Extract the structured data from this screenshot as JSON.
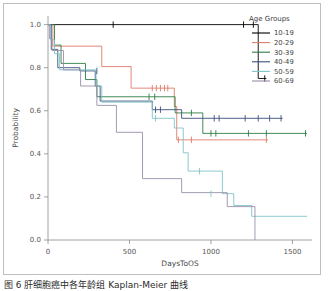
{
  "figure": {
    "caption": "图 6   肝细胞癌中各年龄组 Kaplan-Meier 曲线",
    "background_color": "#ffffff",
    "frame_color": "#bfbfbf"
  },
  "legend": {
    "title": "Age Groups",
    "position": "top-right",
    "entries": [
      {
        "label": "10-19",
        "color": "#000000"
      },
      {
        "label": "20-29",
        "color": "#e07b6a"
      },
      {
        "label": "30-39",
        "color": "#2f7d46"
      },
      {
        "label": "40-49",
        "color": "#3b4f7d"
      },
      {
        "label": "50-59",
        "color": "#7fc4c9"
      },
      {
        "label": "60-69",
        "color": "#9a8fa8"
      }
    ]
  },
  "chart_data": {
    "type": "line",
    "title": "",
    "subtitle": "",
    "xlabel": "DaysToOS",
    "ylabel": "Probability",
    "xlim": [
      0,
      1620
    ],
    "ylim": [
      0.0,
      1.04
    ],
    "xticks": [
      0,
      500,
      1000,
      1500
    ],
    "xtick_labels": [
      "0",
      "500",
      "1000",
      "1500"
    ],
    "yticks": [
      0.0,
      0.2,
      0.4,
      0.6,
      0.8,
      1.0
    ],
    "ytick_labels": [
      "0.0",
      "0.2",
      "0.4",
      "0.6",
      "0.8",
      "1.0"
    ],
    "grid": false,
    "legend_position": "upper right",
    "series": [
      {
        "name": "10-19",
        "color": "#000000",
        "points": [
          [
            0,
            1.0
          ],
          [
            1290,
            1.0
          ],
          [
            1290,
            0.75
          ],
          [
            1340,
            0.75
          ]
        ],
        "censored": [
          [
            400,
            1.0
          ],
          [
            1200,
            1.0
          ],
          [
            1260,
            1.0
          ],
          [
            1330,
            0.75
          ]
        ]
      },
      {
        "name": "20-29",
        "color": "#e07b6a",
        "points": [
          [
            0,
            1.0
          ],
          [
            30,
            1.0
          ],
          [
            30,
            0.9
          ],
          [
            330,
            0.9
          ],
          [
            330,
            0.805
          ],
          [
            510,
            0.805
          ],
          [
            510,
            0.705
          ],
          [
            775,
            0.705
          ],
          [
            775,
            0.62
          ],
          [
            790,
            0.62
          ],
          [
            790,
            0.465
          ],
          [
            1350,
            0.465
          ]
        ],
        "censored": [
          [
            640,
            0.705
          ],
          [
            665,
            0.705
          ],
          [
            690,
            0.705
          ],
          [
            715,
            0.705
          ],
          [
            735,
            0.705
          ],
          [
            800,
            0.465
          ],
          [
            880,
            0.465
          ],
          [
            1340,
            0.465
          ]
        ]
      },
      {
        "name": "30-39",
        "color": "#2f7d46",
        "points": [
          [
            0,
            1.0
          ],
          [
            40,
            1.0
          ],
          [
            40,
            0.905
          ],
          [
            80,
            0.905
          ],
          [
            80,
            0.82
          ],
          [
            230,
            0.82
          ],
          [
            230,
            0.745
          ],
          [
            300,
            0.745
          ],
          [
            300,
            0.665
          ],
          [
            780,
            0.665
          ],
          [
            780,
            0.59
          ],
          [
            950,
            0.59
          ],
          [
            950,
            0.495
          ],
          [
            1590,
            0.495
          ]
        ],
        "censored": [
          [
            620,
            0.665
          ],
          [
            655,
            0.665
          ],
          [
            880,
            0.59
          ],
          [
            1000,
            0.495
          ],
          [
            1030,
            0.495
          ],
          [
            1230,
            0.495
          ],
          [
            1340,
            0.495
          ],
          [
            1580,
            0.495
          ]
        ]
      },
      {
        "name": "40-49",
        "color": "#3b4f7d",
        "points": [
          [
            0,
            1.0
          ],
          [
            20,
            1.0
          ],
          [
            20,
            0.885
          ],
          [
            60,
            0.885
          ],
          [
            60,
            0.8
          ],
          [
            195,
            0.8
          ],
          [
            195,
            0.785
          ],
          [
            290,
            0.785
          ],
          [
            290,
            0.715
          ],
          [
            320,
            0.715
          ],
          [
            320,
            0.645
          ],
          [
            640,
            0.645
          ],
          [
            640,
            0.605
          ],
          [
            820,
            0.605
          ],
          [
            820,
            0.565
          ],
          [
            1440,
            0.565
          ]
        ],
        "censored": [
          [
            300,
            0.785
          ],
          [
            660,
            0.605
          ],
          [
            690,
            0.605
          ],
          [
            1020,
            0.565
          ],
          [
            1050,
            0.565
          ],
          [
            1210,
            0.565
          ],
          [
            1290,
            0.565
          ],
          [
            1360,
            0.565
          ],
          [
            1430,
            0.565
          ]
        ]
      },
      {
        "name": "50-59",
        "color": "#7fc4c9",
        "points": [
          [
            0,
            1.0
          ],
          [
            15,
            1.0
          ],
          [
            15,
            0.93
          ],
          [
            40,
            0.93
          ],
          [
            40,
            0.865
          ],
          [
            70,
            0.865
          ],
          [
            70,
            0.79
          ],
          [
            295,
            0.79
          ],
          [
            295,
            0.715
          ],
          [
            330,
            0.715
          ],
          [
            330,
            0.64
          ],
          [
            640,
            0.64
          ],
          [
            640,
            0.565
          ],
          [
            775,
            0.565
          ],
          [
            775,
            0.52
          ],
          [
            830,
            0.52
          ],
          [
            830,
            0.405
          ],
          [
            860,
            0.405
          ],
          [
            860,
            0.32
          ],
          [
            1070,
            0.32
          ],
          [
            1070,
            0.215
          ],
          [
            1140,
            0.215
          ],
          [
            1140,
            0.16
          ],
          [
            1250,
            0.16
          ],
          [
            1250,
            0.11
          ],
          [
            1590,
            0.11
          ]
        ],
        "censored": [
          [
            660,
            0.565
          ],
          [
            930,
            0.32
          ],
          [
            1000,
            0.215
          ]
        ]
      },
      {
        "name": "60-69",
        "color": "#9a8fa8",
        "points": [
          [
            0,
            1.0
          ],
          [
            10,
            1.0
          ],
          [
            10,
            0.935
          ],
          [
            25,
            0.935
          ],
          [
            25,
            0.88
          ],
          [
            95,
            0.88
          ],
          [
            95,
            0.79
          ],
          [
            200,
            0.79
          ],
          [
            200,
            0.715
          ],
          [
            300,
            0.715
          ],
          [
            300,
            0.625
          ],
          [
            420,
            0.625
          ],
          [
            420,
            0.5
          ],
          [
            580,
            0.5
          ],
          [
            580,
            0.285
          ],
          [
            820,
            0.285
          ],
          [
            820,
            0.22
          ],
          [
            1100,
            0.22
          ],
          [
            1100,
            0.155
          ],
          [
            1270,
            0.155
          ],
          [
            1270,
            0.0
          ]
        ],
        "censored": []
      }
    ]
  }
}
